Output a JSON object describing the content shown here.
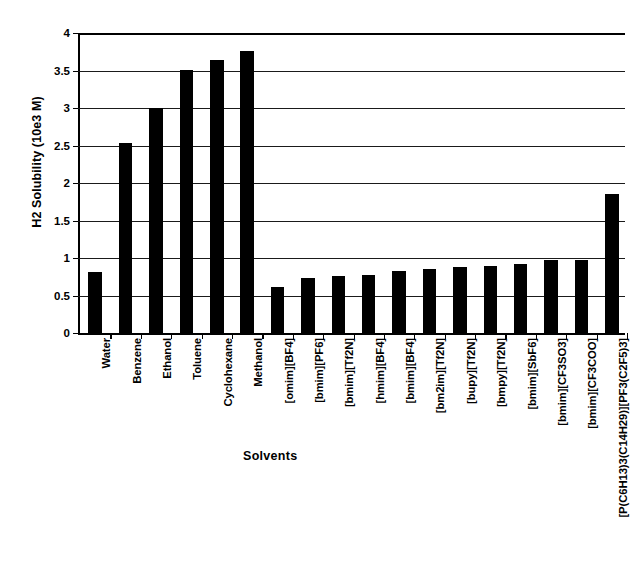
{
  "chart_data": {
    "type": "bar",
    "title": "",
    "xlabel": "Solvents",
    "ylabel": "H2 Solubility (10e3 M)",
    "ylim": [
      0,
      4
    ],
    "ytick_labels": [
      "0",
      "0.5",
      "1",
      "1.5",
      "2",
      "2.5",
      "3",
      "3.5",
      "4"
    ],
    "ytick_values": [
      0,
      0.5,
      1,
      1.5,
      2,
      2.5,
      3,
      3.5,
      4
    ],
    "grid": "horizontal",
    "legend": "none",
    "bar_color": "#000000",
    "categories": [
      "Water",
      "Benzene",
      "Ethanol",
      "Toluene",
      "Cyclohexane",
      "Methanol",
      "[omim][BF4]",
      "[bmim][PF6]",
      "[bmim][Tf2N]",
      "[hmim][BF4]",
      "[bmim][BF4]",
      "[bm2im][Tf2N]",
      "[bupy][Tf2N]",
      "[bmpy][Tf2N]",
      "[bmim][SbF6]",
      "[bmim][CF3SO3]",
      "[bmim][CF3COO]",
      "[P(C6H13)3(C14H29)][PF3(C2F5)3]"
    ],
    "values": [
      0.82,
      2.54,
      3.0,
      3.51,
      3.64,
      3.76,
      0.61,
      0.73,
      0.76,
      0.78,
      0.83,
      0.85,
      0.88,
      0.89,
      0.92,
      0.98,
      0.98,
      1.86
    ]
  }
}
